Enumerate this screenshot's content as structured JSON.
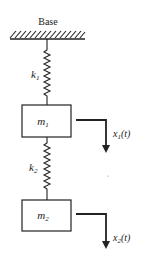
{
  "diagram": {
    "base": {
      "label": "Base"
    },
    "springs": [
      {
        "id": "k1",
        "label": "k",
        "subscript": "1"
      },
      {
        "id": "k2",
        "label": "k",
        "subscript": "2"
      }
    ],
    "masses": [
      {
        "id": "m1",
        "label": "m",
        "subscript": "1"
      },
      {
        "id": "m2",
        "label": "m",
        "subscript": "2"
      }
    ],
    "displacements": [
      {
        "id": "x1",
        "label": "x",
        "subscript": "1",
        "arg": "(t)"
      },
      {
        "id": "x2",
        "label": "x",
        "subscript": "2",
        "arg": "(t)"
      }
    ],
    "colors": {
      "stroke": "#222222",
      "background": "#ffffff"
    }
  }
}
